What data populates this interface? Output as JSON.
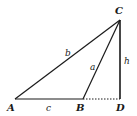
{
  "figure": {
    "type": "triangle-with-altitude",
    "colors": {
      "stroke": "#1a1a1a",
      "background": "#ffffff"
    },
    "points": {
      "A": {
        "label": "A",
        "x": 15,
        "y": 99
      },
      "B": {
        "label": "B",
        "x": 83,
        "y": 99
      },
      "C": {
        "label": "C",
        "x": 120,
        "y": 20
      },
      "D": {
        "label": "D",
        "x": 120,
        "y": 99
      }
    },
    "sides": {
      "a": {
        "label": "a",
        "from": "B",
        "to": "C"
      },
      "b": {
        "label": "b",
        "from": "A",
        "to": "C"
      },
      "c": {
        "label": "c",
        "from": "A",
        "to": "B"
      },
      "h": {
        "label": "h",
        "from": "C",
        "to": "D"
      }
    },
    "extension": {
      "from": "B",
      "to": "D",
      "style": "dotted"
    }
  }
}
